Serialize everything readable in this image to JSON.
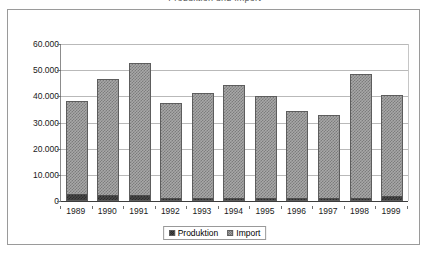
{
  "clipped_title": "Produktion und Import",
  "chart_data": {
    "type": "bar",
    "subtype": "stacked",
    "title": "",
    "xlabel": "",
    "ylabel": "",
    "categories": [
      "1989",
      "1990",
      "1991",
      "1992",
      "1993",
      "1994",
      "1995",
      "1996",
      "1997",
      "1998",
      "1999"
    ],
    "series": [
      {
        "name": "Produktion",
        "color": "#4a4a4a",
        "pattern": "dark-checker",
        "values": [
          2300,
          1900,
          2000,
          300,
          500,
          600,
          400,
          300,
          300,
          500,
          1600
        ]
      },
      {
        "name": "Import",
        "color": "#a8a8a8",
        "pattern": "light-checker",
        "values": [
          36100,
          44700,
          50800,
          37100,
          40700,
          43700,
          39900,
          34100,
          32700,
          47900,
          38800
        ]
      }
    ],
    "totals": [
      38400,
      46600,
      52800,
      37400,
      41200,
      44300,
      40300,
      34400,
      33000,
      48400,
      40400
    ],
    "ytick_labels": [
      "60.000",
      "50.000",
      "40.000",
      "30.000",
      "20.000",
      "10.000",
      "0"
    ],
    "ytick_values": [
      60000,
      50000,
      40000,
      30000,
      20000,
      10000,
      0
    ],
    "ylim": [
      0,
      60000
    ],
    "grid": "horizontal",
    "legend_position": "bottom-center",
    "legend_entries": [
      "Produktion",
      "Import"
    ]
  }
}
